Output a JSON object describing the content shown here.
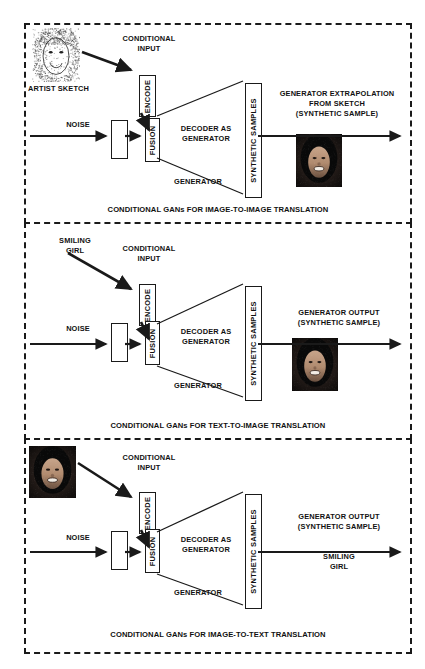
{
  "figure": {
    "panel_count": 3
  },
  "common": {
    "noise_label": "NOISE",
    "conditional_input_label": "CONDITIONAL\nINPUT",
    "encode_label": "ENCODE",
    "fusion_label": "FUSION",
    "decoder_label": "DECODER AS\nGENERATOR",
    "generator_label": "GENERATOR",
    "synthetic_samples_label": "SYNTHETIC SAMPLES"
  },
  "panels": [
    {
      "id": "image-to-image",
      "caption": "CONDITIONAL GANs FOR IMAGE-TO-IMAGE TRANSLATION",
      "input_kind": "image",
      "input_image_name": "artist-sketch-portrait",
      "input_image_style": "sketch",
      "input_caption": "ARTIST SKETCH",
      "conditional_input_label": "CONDITIONAL\nINPUT",
      "encode_label": "ENCODE",
      "noise_label": "NOISE",
      "fusion_label": "FUSION",
      "decoder_label": "DECODER AS\nGENERATOR",
      "generator_label": "GENERATOR",
      "synthetic_samples_label": "SYNTHETIC SAMPLES",
      "output_label": "GENERATOR EXTRAPOLATION\nFROM SKETCH\n(SYNTHETIC SAMPLE)",
      "output_kind": "image",
      "output_image_name": "synthetic-face-portrait",
      "output_text": ""
    },
    {
      "id": "text-to-image",
      "caption": "CONDITIONAL GANs FOR TEXT-TO-IMAGE TRANSLATION",
      "input_kind": "text",
      "input_image_name": "",
      "input_image_style": "",
      "input_caption": "SMILING\nGIRL",
      "conditional_input_label": "CONDITIONAL\nINPUT",
      "encode_label": "ENCODE",
      "noise_label": "NOISE",
      "fusion_label": "FUSION",
      "decoder_label": "DECODER AS\nGENERATOR",
      "generator_label": "GENERATOR",
      "synthetic_samples_label": "SYNTHETIC SAMPLES",
      "output_label": "GENERATOR OUTPUT\n(SYNTHETIC SAMPLE)",
      "output_kind": "image",
      "output_image_name": "synthetic-face-portrait",
      "output_text": ""
    },
    {
      "id": "image-to-text",
      "caption": "CONDITIONAL GANs FOR IMAGE-TO-TEXT TRANSLATION",
      "input_kind": "image",
      "input_image_name": "input-face-portrait",
      "input_image_style": "photo",
      "input_caption": "",
      "conditional_input_label": "CONDITIONAL\nINPUT",
      "encode_label": "ENCODE",
      "noise_label": "NOISE",
      "fusion_label": "FUSION",
      "decoder_label": "DECODER AS\nGENERATOR",
      "generator_label": "GENERATOR",
      "synthetic_samples_label": "SYNTHETIC SAMPLES",
      "output_label": "GENERATOR OUTPUT\n(SYNTHETIC SAMPLE)",
      "output_kind": "text",
      "output_image_name": "",
      "output_text": "SMILING\nGIRL"
    }
  ],
  "colors": {
    "ink": "#1a1a1a",
    "background": "#ffffff"
  }
}
